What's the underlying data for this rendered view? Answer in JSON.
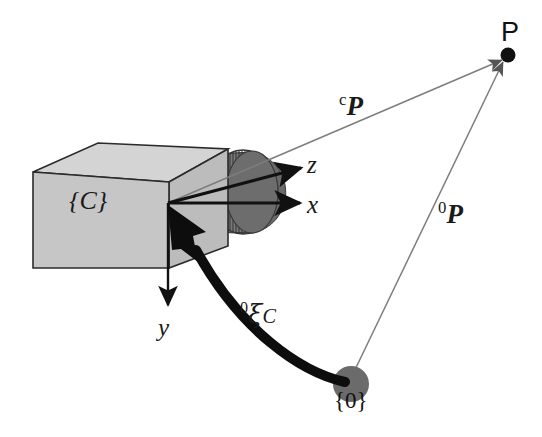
{
  "figure": {
    "type": "diagram",
    "background_color": "#ffffff",
    "width": 542,
    "height": 437
  },
  "colors": {
    "box_front": "#c3c3c3",
    "box_top": "#d2d2d2",
    "box_side": "#b9b9b9",
    "box_outline": "#2b2b2b",
    "lens_dark": "#6f6f6f",
    "lens_mid": "#7d7d7d",
    "lens_rib": "#3a3a3a",
    "origin_dot": "#6b6b6b",
    "point_dot": "#111111",
    "vector_line": "#7a7a7a",
    "axis_line": "#111111",
    "pose_arrow": "#0d0d0d",
    "text": "#1a1a1a"
  },
  "labels": {
    "camera_frame": "{C}",
    "world_frame": "{0}",
    "point": "P",
    "axis_x": "x",
    "axis_y": "y",
    "axis_z": "z",
    "vector_camera_to_point_sup": "c",
    "vector_camera_to_point_base": "P",
    "vector_world_to_point_sup": "0",
    "vector_world_to_point_base": "P",
    "pose_sup": "0",
    "pose_glyph": "ξ",
    "pose_sub": "C"
  },
  "elements": {
    "camera_body": "gray-rectangular-box",
    "camera_lens": "dark-ribbed-cylinder",
    "camera_origin": "coordinate-frame-origin",
    "world_origin_marker": "filled-gray-circle",
    "target_point_marker": "filled-black-dot",
    "pose_arrow": "thick-curved-arrow",
    "ray_camera_to_point": "thin-gray-arrow",
    "ray_world_to_point": "thin-gray-arrow"
  },
  "geometry": {
    "camera_origin": {
      "x": 168,
      "y": 203
    },
    "world_origin": {
      "x": 351,
      "y": 384
    },
    "target_point": {
      "x": 508,
      "y": 55
    }
  }
}
